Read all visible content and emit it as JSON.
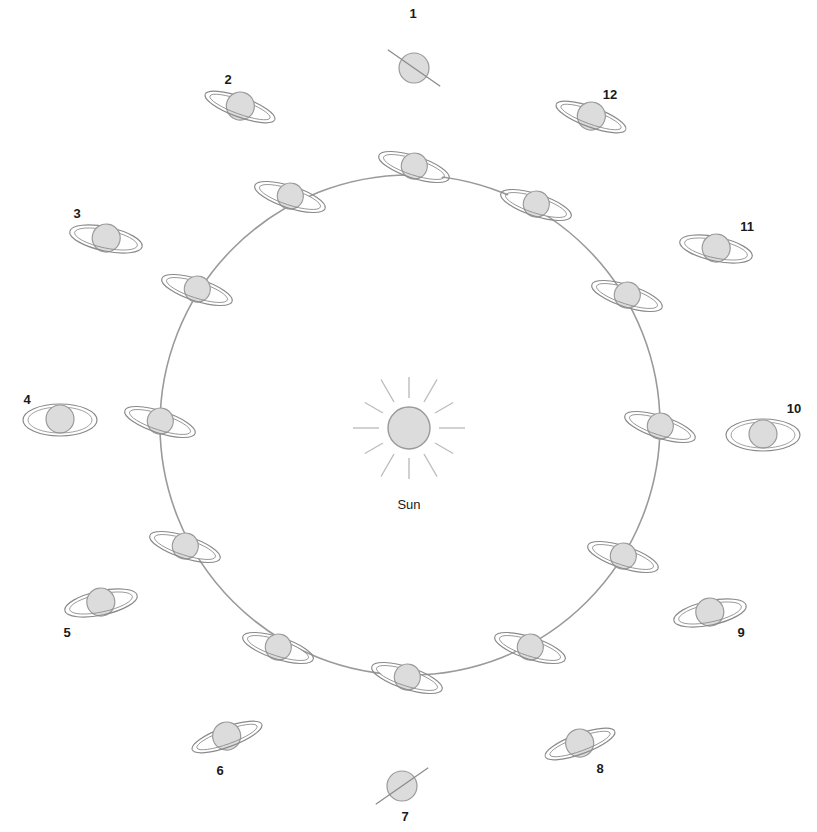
{
  "diagram": {
    "sun": {
      "label": "Sun",
      "cx": 409,
      "cy": 428,
      "r": 21
    },
    "orbit": {
      "cx": 410,
      "cy": 425,
      "r": 250,
      "color": "#9a9a9a"
    },
    "colors": {
      "planet_fill": "#dcdcdc",
      "planet_stroke": "#9a9a9a",
      "ring_stroke": "#8a8a8a",
      "ray": "#bdbdbd",
      "text": "#1a1a1a"
    },
    "inner_planets": [
      {
        "cx": 414,
        "cy": 167
      },
      {
        "cx": 536,
        "cy": 205
      },
      {
        "cx": 627,
        "cy": 296
      },
      {
        "cx": 660,
        "cy": 427
      },
      {
        "cx": 623,
        "cy": 557
      },
      {
        "cx": 530,
        "cy": 648
      },
      {
        "cx": 407,
        "cy": 678
      },
      {
        "cx": 278,
        "cy": 648
      },
      {
        "cx": 185,
        "cy": 547
      },
      {
        "cx": 160,
        "cy": 422
      },
      {
        "cx": 197,
        "cy": 290
      },
      {
        "cx": 290,
        "cy": 197
      }
    ],
    "outer_views": [
      {
        "label": "1",
        "cx": 414,
        "cy": 68,
        "ring": "edge",
        "tilt": 35,
        "lx": 413,
        "ly": 18
      },
      {
        "label": "2",
        "cx": 240,
        "cy": 107,
        "ring": "open",
        "tilt": 20,
        "ry": 10,
        "lx": 228,
        "ly": 84
      },
      {
        "label": "3",
        "cx": 106,
        "cy": 239,
        "ring": "open",
        "tilt": 12,
        "ry": 12,
        "lx": 77,
        "ly": 218
      },
      {
        "label": "4",
        "cx": 60,
        "cy": 420,
        "ring": "open",
        "tilt": 0,
        "ry": 16,
        "lx": 27,
        "ly": 404
      },
      {
        "label": "5",
        "cx": 101,
        "cy": 603,
        "ring": "open",
        "tilt": -12,
        "ry": 12,
        "lx": 67,
        "ly": 637
      },
      {
        "label": "6",
        "cx": 227,
        "cy": 737,
        "ring": "open",
        "tilt": -20,
        "ry": 10,
        "lx": 220,
        "ly": 775
      },
      {
        "label": "7",
        "cx": 402,
        "cy": 786,
        "ring": "edge",
        "tilt": -35,
        "lx": 405,
        "ly": 821
      },
      {
        "label": "8",
        "cx": 580,
        "cy": 744,
        "ring": "open",
        "tilt": -20,
        "ry": 10,
        "lx": 600,
        "ly": 773
      },
      {
        "label": "9",
        "cx": 710,
        "cy": 613,
        "ring": "open",
        "tilt": -12,
        "ry": 12,
        "lx": 741,
        "ly": 637
      },
      {
        "label": "10",
        "cx": 763,
        "cy": 435,
        "ring": "open",
        "tilt": 0,
        "ry": 16,
        "lx": 794,
        "ly": 413
      },
      {
        "label": "11",
        "cx": 716,
        "cy": 249,
        "ring": "open",
        "tilt": 12,
        "ry": 12,
        "lx": 747,
        "ly": 231
      },
      {
        "label": "12",
        "cx": 591,
        "cy": 117,
        "ring": "open",
        "tilt": 20,
        "ry": 10,
        "lx": 610,
        "ly": 99
      }
    ]
  }
}
